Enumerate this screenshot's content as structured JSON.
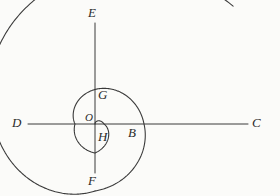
{
  "figure": {
    "background_color": "#fbfbf9",
    "stroke_color": "#3a3a3a",
    "label_color": "#2b2b2b",
    "width": 280,
    "height": 196,
    "origin": {
      "x": 95,
      "y": 124,
      "label": "O"
    },
    "axes": {
      "horizontal": {
        "name": "horizontal-axis",
        "x1": 28,
        "y1": 124,
        "x2": 248,
        "y2": 124
      },
      "vertical": {
        "name": "vertical-axis",
        "x1": 95,
        "y1": 23,
        "x2": 95,
        "y2": 173
      }
    },
    "spiral": {
      "type": "archimedean",
      "turns": 2.6,
      "description": "r increases linearly with angle from the origin O, sweeping outward through H, B, G, E, D, F and ending past C"
    },
    "labels": [
      {
        "id": "E",
        "text": "E",
        "x": 88,
        "y": 6,
        "size": "normal",
        "role": "spiral-intercept-top"
      },
      {
        "id": "G",
        "text": "G",
        "x": 98,
        "y": 88,
        "size": "normal",
        "role": "spiral-intercept-upper-inner"
      },
      {
        "id": "O",
        "text": "O",
        "x": 85,
        "y": 112,
        "size": "small",
        "role": "origin"
      },
      {
        "id": "D",
        "text": "D",
        "x": 12,
        "y": 116,
        "size": "normal",
        "role": "spiral-intercept-left"
      },
      {
        "id": "B",
        "text": "B",
        "x": 128,
        "y": 126,
        "size": "normal",
        "role": "spiral-intercept-right-inner"
      },
      {
        "id": "C",
        "text": "C",
        "x": 252,
        "y": 116,
        "size": "normal",
        "role": "spiral-intercept-right-outer"
      },
      {
        "id": "H",
        "text": "H",
        "x": 98,
        "y": 130,
        "size": "normal",
        "role": "spiral-intercept-lower-inner"
      },
      {
        "id": "F",
        "text": "F",
        "x": 88,
        "y": 174,
        "size": "normal",
        "role": "spiral-intercept-bottom"
      }
    ],
    "intercepts": {
      "E": {
        "x": 95,
        "y": 23
      },
      "G": {
        "x": 95,
        "y": 104
      },
      "O": {
        "x": 95,
        "y": 124
      },
      "D": {
        "x": 28,
        "y": 124
      },
      "B": {
        "x": 124,
        "y": 124
      },
      "C": {
        "x": 248,
        "y": 124
      },
      "H": {
        "x": 95,
        "y": 133
      },
      "F": {
        "x": 95,
        "y": 173
      }
    }
  }
}
